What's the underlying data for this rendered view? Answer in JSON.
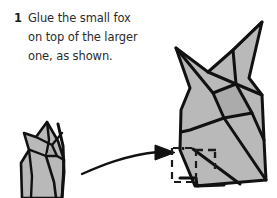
{
  "page": {
    "background_color": "#ffffff",
    "width": 277,
    "height": 198
  },
  "instruction": {
    "step_number": "1",
    "text": "Glue the small fox\non top of the larger\none, as shown.",
    "lines": [
      "Glue the small fox",
      "on top of the larger",
      "one, as shown."
    ],
    "text_color": "#2b2b2b",
    "number_color": "#1b1b1b"
  },
  "diagram": {
    "type": "origami-assembly-instruction",
    "stroke_color": "#111111",
    "paper_fill": "#b9b9b9",
    "paper_fill_shade": "#ababab",
    "guide_color": "#1a1a1a",
    "small_fox": {
      "label": "small fox",
      "position": "bottom-left",
      "cropped_at_bottom": true
    },
    "arrow": {
      "label": "curved placement arrow",
      "direction": "right",
      "style": "curved-tapered-solid-head"
    },
    "large_fox": {
      "label": "larger fox",
      "position": "right",
      "ears": 2
    },
    "placement_outline": {
      "label": "dashed placement guide for small fox",
      "style": "dashed",
      "position": "base of larger fox"
    }
  }
}
